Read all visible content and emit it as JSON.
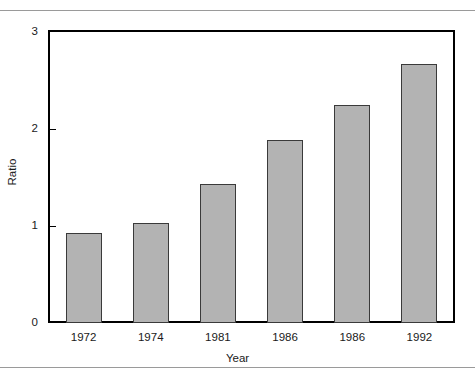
{
  "figure": {
    "background_color": "#ffffff",
    "rule_color": "#9a9a9a",
    "frame_color": "#000000"
  },
  "chart_data": {
    "type": "bar",
    "title": "",
    "subtitle": "",
    "xlabel": "Year",
    "ylabel": "Ratio",
    "categories": [
      "1972",
      "1974",
      "1981",
      "1986",
      "1986",
      "1992"
    ],
    "values": [
      0.93,
      1.03,
      1.43,
      1.89,
      2.25,
      2.67
    ],
    "ylim": [
      0,
      3
    ],
    "yticks": [
      0,
      1,
      2,
      3
    ],
    "ytick_labels": [
      "0",
      "1",
      "2",
      "3"
    ],
    "grid": false,
    "legend": null,
    "legend_position": "none",
    "bar_fill_color": "#b3b3b3",
    "bar_edge_color": "#3a3a3a",
    "annotations": []
  }
}
